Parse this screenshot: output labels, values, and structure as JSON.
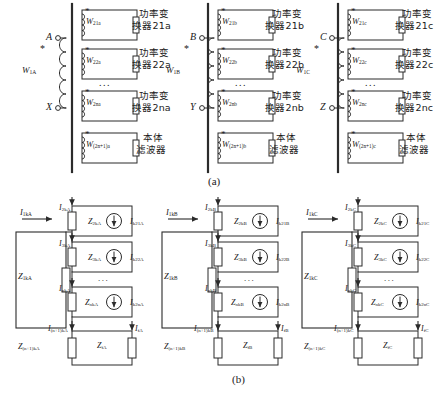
{
  "figure": {
    "caption_a": "(a)",
    "caption_b": "(b)"
  },
  "panel_a": {
    "phases": [
      {
        "id": "A",
        "primary": {
          "winding_label": "W",
          "winding_sub": "1A",
          "terminal_top": "A",
          "terminal_bottom": "X",
          "polarity_mark": "*"
        },
        "secondaries": [
          {
            "winding_label": "W",
            "winding_sub": "21a",
            "polarity_mark": "*",
            "device_line1": "功率变",
            "device_line2": "换器21a"
          },
          {
            "winding_label": "W",
            "winding_sub": "22a",
            "polarity_mark": "*",
            "device_line1": "功率变",
            "device_line2": "换器22a"
          },
          {
            "winding_label": "W",
            "winding_sub": "2na",
            "polarity_mark": "*",
            "device_line1": "功率变",
            "device_line2": "换器2na"
          },
          {
            "winding_label": "W",
            "winding_sub": "(2n+1)a",
            "polarity_mark": "*",
            "device_line1": "本体",
            "device_line2": "滤波器"
          }
        ],
        "ellipsis": "..."
      },
      {
        "id": "B",
        "primary": {
          "winding_label": "W",
          "winding_sub": "1B",
          "terminal_top": "B",
          "terminal_bottom": "Y",
          "polarity_mark": "*"
        },
        "secondaries": [
          {
            "winding_label": "W",
            "winding_sub": "21b",
            "polarity_mark": "*",
            "device_line1": "功率变",
            "device_line2": "换器21b"
          },
          {
            "winding_label": "W",
            "winding_sub": "22b",
            "polarity_mark": "*",
            "device_line1": "功率变",
            "device_line2": "换器22b"
          },
          {
            "winding_label": "W",
            "winding_sub": "2nb",
            "polarity_mark": "*",
            "device_line1": "功率变",
            "device_line2": "换器2nb"
          },
          {
            "winding_label": "W",
            "winding_sub": "(2n+1)b",
            "polarity_mark": "*",
            "device_line1": "本体",
            "device_line2": "滤波器"
          }
        ],
        "ellipsis": "..."
      },
      {
        "id": "C",
        "primary": {
          "winding_label": "W",
          "winding_sub": "1C",
          "terminal_top": "C",
          "terminal_bottom": "Z",
          "polarity_mark": "*"
        },
        "secondaries": [
          {
            "winding_label": "W",
            "winding_sub": "21c",
            "polarity_mark": "*",
            "device_line1": "功率变",
            "device_line2": "换器21c"
          },
          {
            "winding_label": "W",
            "winding_sub": "22c",
            "polarity_mark": "*",
            "device_line1": "功率变",
            "device_line2": "换器22c"
          },
          {
            "winding_label": "W",
            "winding_sub": "2nc",
            "polarity_mark": "*",
            "device_line1": "功率变",
            "device_line2": "换器2nc"
          },
          {
            "winding_label": "W",
            "winding_sub": "(2n+1)c",
            "polarity_mark": "*",
            "device_line1": "本体",
            "device_line2": "滤波器"
          }
        ],
        "ellipsis": "..."
      }
    ]
  },
  "panel_b": {
    "phases": [
      {
        "id": "A",
        "source_current": {
          "sym": "I",
          "sub": "1kA"
        },
        "source_impedance": {
          "sym": "Z",
          "sub": "1kA"
        },
        "branches": [
          {
            "current_in": {
              "sym": "I",
              "sub": "2kA"
            },
            "impedance": {
              "sym": "Z",
              "sub": "2kA"
            },
            "source": {
              "sym": "I",
              "sub": "k21A"
            }
          },
          {
            "current_in": {
              "sym": "I",
              "sub": "3kA"
            },
            "impedance": {
              "sym": "Z",
              "sub": "3kA"
            },
            "source": {
              "sym": "I",
              "sub": "k22A"
            }
          },
          {
            "current_in": {
              "sym": "I",
              "sub": "nkA"
            },
            "impedance": {
              "sym": "Z",
              "sub": "nkA"
            },
            "source": {
              "sym": "I",
              "sub": "k2nA"
            }
          }
        ],
        "ellipsis": "...",
        "filter": {
          "current_in": {
            "sym": "I",
            "sub": "(n+1)kA"
          },
          "impedance_left": {
            "sym": "Z",
            "sub": "(n+1)kA"
          },
          "impedance_mid": {
            "sym": "Z",
            "sub": "fA"
          },
          "current_out": {
            "sym": "I",
            "sub": "fA"
          }
        }
      },
      {
        "id": "B",
        "source_current": {
          "sym": "I",
          "sub": "1kB"
        },
        "source_impedance": {
          "sym": "Z",
          "sub": "1kB"
        },
        "branches": [
          {
            "current_in": {
              "sym": "I",
              "sub": "2kB"
            },
            "impedance": {
              "sym": "Z",
              "sub": "2kB"
            },
            "source": {
              "sym": "I",
              "sub": "k21B"
            }
          },
          {
            "current_in": {
              "sym": "I",
              "sub": "3kB"
            },
            "impedance": {
              "sym": "Z",
              "sub": "3kB"
            },
            "source": {
              "sym": "I",
              "sub": "k22B"
            }
          },
          {
            "current_in": {
              "sym": "I",
              "sub": "nkB"
            },
            "impedance": {
              "sym": "Z",
              "sub": "nkB"
            },
            "source": {
              "sym": "I",
              "sub": "k2nB"
            }
          }
        ],
        "ellipsis": "...",
        "filter": {
          "current_in": {
            "sym": "I",
            "sub": "(n+1)kB"
          },
          "impedance_left": {
            "sym": "Z",
            "sub": "(n+1)kB"
          },
          "impedance_mid": {
            "sym": "Z",
            "sub": "fB"
          },
          "current_out": {
            "sym": "I",
            "sub": "fB"
          }
        }
      },
      {
        "id": "C",
        "source_current": {
          "sym": "I",
          "sub": "1kC"
        },
        "source_impedance": {
          "sym": "Z",
          "sub": "1kC"
        },
        "branches": [
          {
            "current_in": {
              "sym": "I",
              "sub": "2kC"
            },
            "impedance": {
              "sym": "Z",
              "sub": "2kC"
            },
            "source": {
              "sym": "I",
              "sub": "k21C"
            }
          },
          {
            "current_in": {
              "sym": "I",
              "sub": "3kC"
            },
            "impedance": {
              "sym": "Z",
              "sub": "3kC"
            },
            "source": {
              "sym": "I",
              "sub": "k22C"
            }
          },
          {
            "current_in": {
              "sym": "I",
              "sub": "nkC"
            },
            "impedance": {
              "sym": "Z",
              "sub": "nkC"
            },
            "source": {
              "sym": "I",
              "sub": "k2nC"
            }
          }
        ],
        "ellipsis": "...",
        "filter": {
          "current_in": {
            "sym": "I",
            "sub": "(n+1)kC"
          },
          "impedance_left": {
            "sym": "Z",
            "sub": "(n+1)kC"
          },
          "impedance_mid": {
            "sym": "Z",
            "sub": "fC"
          },
          "current_out": {
            "sym": "I",
            "sub": "fC"
          }
        }
      }
    ]
  },
  "style": {
    "line_color": "#2b2b2b",
    "text_color": "#1a1a1a",
    "background": "#ffffff"
  }
}
